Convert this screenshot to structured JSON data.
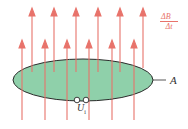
{
  "diagram": {
    "type": "physics-induction",
    "colors": {
      "field_arrows": "#e8736b",
      "area_fill": "#8fd0aa",
      "area_stroke": "#2b2b2b",
      "label_text": "#333333"
    },
    "labels": {
      "field_change_numerator": "ΔB⃗",
      "field_change_denominator": "Δt",
      "area": "A",
      "voltage": "U",
      "voltage_subscript": "i"
    },
    "arrows_tall_x": [
      32,
      54,
      76,
      98,
      120,
      143
    ],
    "arrows_short_x": [
      22,
      45,
      67,
      89,
      112,
      134
    ]
  }
}
